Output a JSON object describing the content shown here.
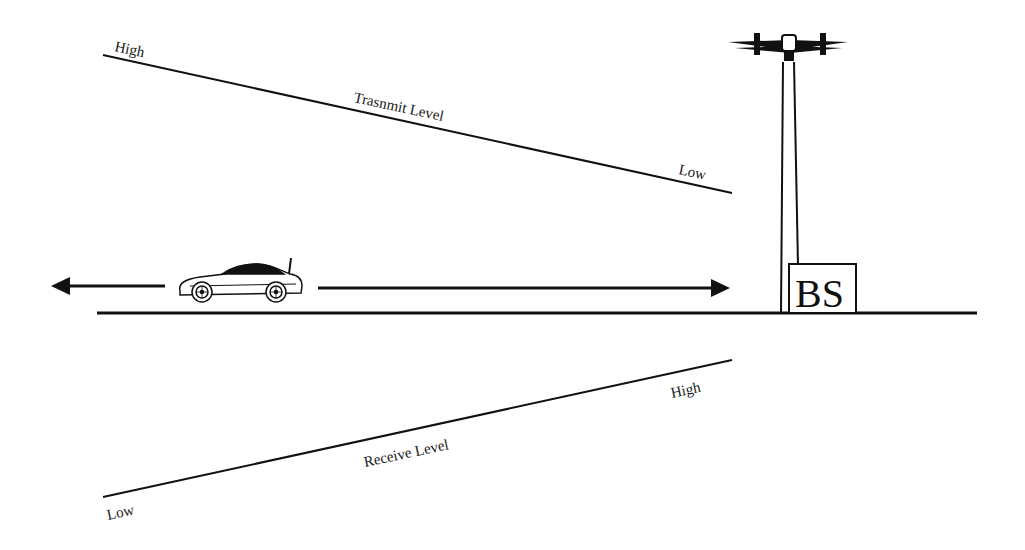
{
  "diagram": {
    "transmit": {
      "title": "Trasnmit Level",
      "start_label": "High",
      "end_label": "Low"
    },
    "receive": {
      "title": "Receive Level",
      "start_label": "Low",
      "end_label": "High"
    },
    "base_station": {
      "label": "BS"
    },
    "colors": {
      "stroke": "#111111",
      "background": "#ffffff"
    }
  }
}
